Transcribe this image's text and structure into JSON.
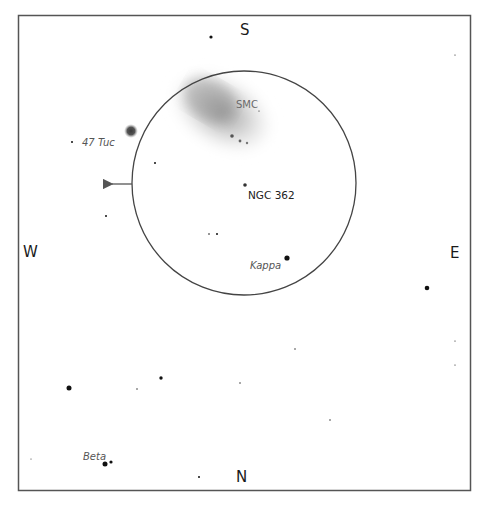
{
  "chart": {
    "frame": {
      "x": 18,
      "y": 15,
      "width": 452,
      "height": 475,
      "stroke": "#555555"
    },
    "field_circle": {
      "cx": 244,
      "cy": 183,
      "r": 112,
      "stroke": "#444444"
    },
    "motion_arrow": {
      "x1": 132,
      "y1": 184,
      "x2": 109,
      "y2": 184,
      "direction": "west",
      "color": "#555555"
    }
  },
  "cardinals": [
    {
      "id": "S",
      "label": "S",
      "x": 240,
      "y": 35
    },
    {
      "id": "N",
      "label": "N",
      "x": 242,
      "y": 480
    },
    {
      "id": "W",
      "label": "W",
      "x": 26,
      "y": 256
    },
    {
      "id": "E",
      "label": "E",
      "x": 451,
      "y": 257
    }
  ],
  "objects": [
    {
      "id": "smc",
      "label": "SMC",
      "type": "galaxy",
      "label_x": 236,
      "label_y": 108
    },
    {
      "id": "tuc47",
      "label": "47 Tuc",
      "type": "globular-cluster",
      "x": 131,
      "y": 131,
      "label_x": 82,
      "label_y": 146
    },
    {
      "id": "ngc362",
      "label": "NGC 362",
      "type": "globular-cluster",
      "x": 245,
      "y": 185,
      "label_x": 248,
      "label_y": 198
    },
    {
      "id": "kappa",
      "label": "Kappa",
      "type": "star",
      "x": 287,
      "y": 258,
      "label_x": 250,
      "label_y": 268
    },
    {
      "id": "beta",
      "label": "Beta",
      "type": "double-star",
      "x": 105,
      "y": 464,
      "label_x": 83,
      "label_y": 460
    }
  ],
  "stars": [
    {
      "x": 211,
      "y": 37,
      "r": 1.6
    },
    {
      "x": 72,
      "y": 142,
      "r": 1.0
    },
    {
      "x": 155,
      "y": 163,
      "r": 1.0
    },
    {
      "x": 106,
      "y": 216,
      "r": 1.0
    },
    {
      "x": 209,
      "y": 234,
      "r": 0.8
    },
    {
      "x": 217,
      "y": 234,
      "r": 1.0
    },
    {
      "x": 287,
      "y": 258,
      "r": 2.6
    },
    {
      "x": 427,
      "y": 288,
      "r": 2.3
    },
    {
      "x": 69,
      "y": 388,
      "r": 2.5
    },
    {
      "x": 161,
      "y": 378,
      "r": 1.7
    },
    {
      "x": 137,
      "y": 389,
      "r": 0.7
    },
    {
      "x": 240,
      "y": 383,
      "r": 0.7
    },
    {
      "x": 295,
      "y": 349,
      "r": 0.7
    },
    {
      "x": 330,
      "y": 420,
      "r": 0.7
    },
    {
      "x": 455,
      "y": 341,
      "r": 0.6
    },
    {
      "x": 455,
      "y": 365,
      "r": 0.6
    },
    {
      "x": 455,
      "y": 55,
      "r": 0.6
    },
    {
      "x": 199,
      "y": 477,
      "r": 1.0
    },
    {
      "x": 105,
      "y": 464,
      "r": 2.5
    },
    {
      "x": 111,
      "y": 462,
      "r": 1.6
    },
    {
      "x": 31,
      "y": 459,
      "r": 0.5
    },
    {
      "x": 259,
      "y": 111,
      "r": 0.6
    },
    {
      "x": 232,
      "y": 136,
      "r": 1.8,
      "color": "#555"
    },
    {
      "x": 240,
      "y": 141,
      "r": 1.4,
      "color": "#666"
    },
    {
      "x": 247,
      "y": 143,
      "r": 1.2,
      "color": "#777"
    }
  ]
}
